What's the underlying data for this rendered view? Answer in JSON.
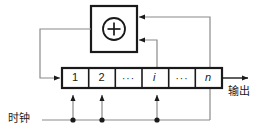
{
  "diagram": {
    "type": "block-diagram",
    "colors": {
      "stroke": "#1a1a1a",
      "wire": "#8a8a8a",
      "background": "#ffffff"
    },
    "adder": {
      "symbol": "+",
      "operator_name": "modulo-2 adder",
      "inputs": 2
    },
    "register": {
      "name": "shift-register",
      "cells": [
        {
          "label": "1",
          "italic": false,
          "clocked": true
        },
        {
          "label": "2",
          "italic": false,
          "clocked": true
        },
        {
          "label": "···",
          "italic": false,
          "clocked": false
        },
        {
          "label": "i",
          "italic": true,
          "clocked": true
        },
        {
          "label": "···",
          "italic": false,
          "clocked": false
        },
        {
          "label": "n",
          "italic": true,
          "clocked": false
        }
      ]
    },
    "labels": {
      "clock": "时钟",
      "output": "输出"
    }
  }
}
